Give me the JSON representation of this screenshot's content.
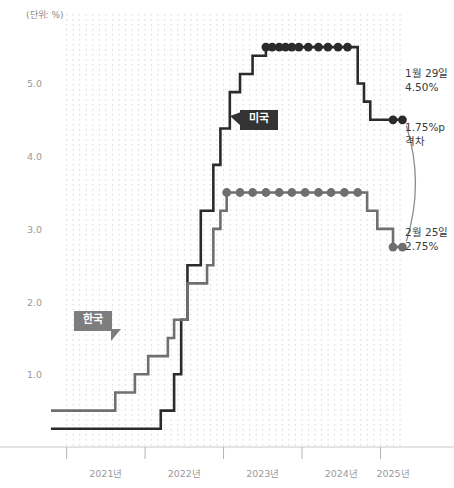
{
  "unit_note": "(단위: %)",
  "labels": {
    "us": "미국",
    "kr": "한국"
  },
  "annotations": {
    "us_end_date": "1월 29일",
    "us_end_value": "4.50%",
    "gap_value": "1.75%p",
    "gap_word": "격차",
    "kr_end_date": "2월 25일",
    "kr_end_value": "2.75%"
  },
  "colors": {
    "us_line": "#2b2b2b",
    "kr_line": "#6f6f6f",
    "axis": "#c8c8c8",
    "gridline": "#d9d9d9",
    "tick_text": "#9a9a9a"
  },
  "chart_data": {
    "type": "line",
    "title": "",
    "subtitle": "",
    "xlabel": "",
    "ylabel": "(단위: %)",
    "ylim": [
      0,
      5.9
    ],
    "xlim": [
      2020.75,
      2025.3
    ],
    "yticks": [
      1.0,
      2.0,
      3.0,
      4.0,
      5.0
    ],
    "ytick_labels": [
      "1.0",
      "2.0",
      "3.0",
      "4.0",
      "5.0"
    ],
    "xticks": [
      2021,
      2022,
      2023,
      2024,
      2025
    ],
    "xtick_labels": [
      "2021년",
      "2022년",
      "2023년",
      "2024년",
      "2025년"
    ],
    "grid": "vertical-dotted",
    "legend_position": "inline-callouts",
    "step_style": "post",
    "series": [
      {
        "name": "미국",
        "label": "미국",
        "color": "#2b2b2b",
        "markers": true,
        "x": [
          2020.8,
          2022.2,
          2022.37,
          2022.46,
          2022.54,
          2022.71,
          2022.87,
          2022.96,
          2023.08,
          2023.21,
          2023.37,
          2023.54,
          2023.62,
          2023.71,
          2023.79,
          2023.87,
          2023.96,
          2024.08,
          2024.21,
          2024.33,
          2024.46,
          2024.58,
          2024.71,
          2024.79,
          2024.87,
          2024.96,
          2025.08,
          2025.16
        ],
        "y": [
          0.25,
          0.5,
          1.0,
          1.75,
          2.5,
          3.25,
          3.88,
          4.38,
          4.88,
          5.13,
          5.38,
          5.5,
          5.5,
          5.5,
          5.5,
          5.5,
          5.5,
          5.5,
          5.5,
          5.5,
          5.5,
          5.5,
          5.0,
          4.75,
          4.5,
          4.5,
          4.5,
          4.5
        ]
      },
      {
        "name": "한국",
        "label": "한국",
        "color": "#6f6f6f",
        "markers": true,
        "x": [
          2020.8,
          2021.62,
          2021.87,
          2022.04,
          2022.29,
          2022.37,
          2022.54,
          2022.79,
          2022.87,
          2022.96,
          2023.04,
          2023.21,
          2023.37,
          2023.54,
          2023.71,
          2023.87,
          2024.04,
          2024.21,
          2024.37,
          2024.54,
          2024.71,
          2024.83,
          2024.96,
          2025.08,
          2025.16
        ],
        "y": [
          0.5,
          0.75,
          1.0,
          1.25,
          1.5,
          1.75,
          2.25,
          2.5,
          3.0,
          3.25,
          3.5,
          3.5,
          3.5,
          3.5,
          3.5,
          3.5,
          3.5,
          3.5,
          3.5,
          3.5,
          3.5,
          3.25,
          3.0,
          3.0,
          2.75
        ]
      }
    ],
    "annotations": [
      {
        "text": "1월 29일 4.50%",
        "series": "미국",
        "at_x": 2025.16,
        "at_y": 4.5
      },
      {
        "text": "2월 25일 2.75%",
        "series": "한국",
        "at_x": 2025.16,
        "at_y": 2.75
      },
      {
        "text": "1.75%p 격차",
        "between": [
          "미국",
          "한국"
        ],
        "value": 1.75
      }
    ]
  }
}
